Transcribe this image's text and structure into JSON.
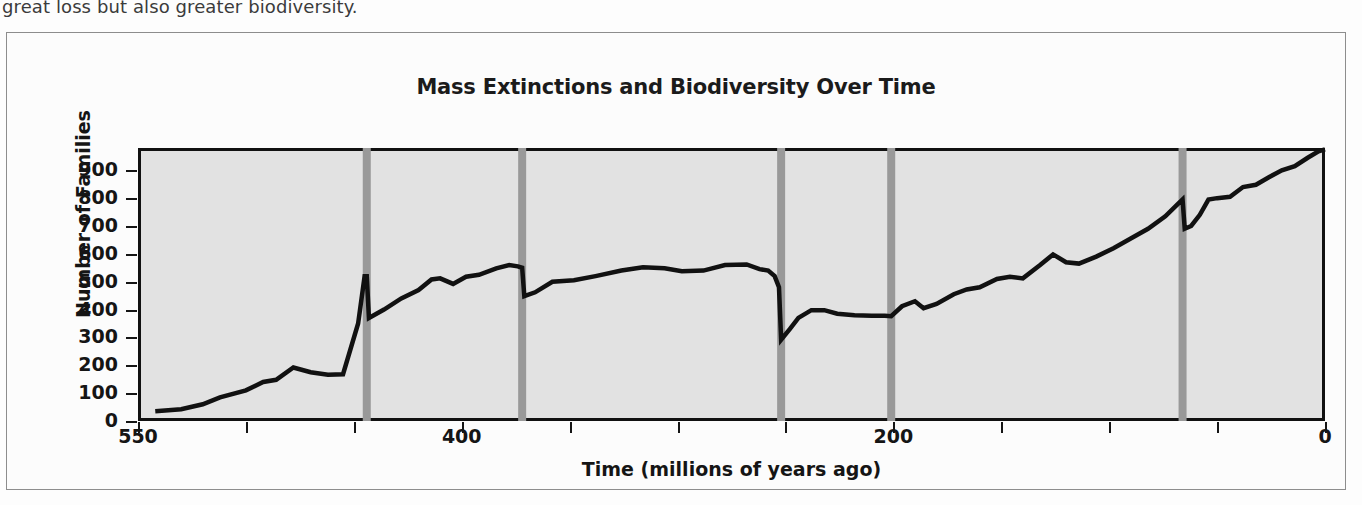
{
  "page": {
    "body_text": "great loss but also greater biodiversity."
  },
  "figure": {
    "title": "Mass Extinctions and Biodiversity Over Time"
  },
  "chart_data": {
    "type": "line",
    "title": "Mass Extinctions and Biodiversity Over Time",
    "xlabel": "Time (millions of years ago)",
    "ylabel": "Number of Families",
    "xlim": [
      550,
      0
    ],
    "ylim": [
      0,
      980
    ],
    "x_axis_reversed": true,
    "grid": false,
    "legend": null,
    "plot_background_color": "#e2e2e2",
    "line_color": "#111111",
    "extinction_bar_color": "#999999",
    "y_ticks": [
      0,
      100,
      200,
      300,
      400,
      500,
      600,
      700,
      800,
      900
    ],
    "y_tick_labels": [
      "0",
      "100",
      "200",
      "300",
      "400",
      "500",
      "600",
      "700",
      "800",
      "900"
    ],
    "x_ticks_major": [
      550,
      400,
      200,
      0
    ],
    "x_tick_labels_major": [
      "550",
      "400",
      "200",
      "0"
    ],
    "x_ticks_minor": [
      500,
      450,
      350,
      300,
      250,
      150,
      100,
      50
    ],
    "extinction_events": [
      {
        "label": "End-Ordovician",
        "time_mya": 444
      },
      {
        "label": "Late Devonian",
        "time_mya": 372
      },
      {
        "label": "End-Permian",
        "time_mya": 252
      },
      {
        "label": "End-Triassic",
        "time_mya": 201
      },
      {
        "label": "End-Cretaceous",
        "time_mya": 66
      }
    ],
    "series": [
      {
        "name": "Number of Families",
        "points": [
          [
            542,
            35
          ],
          [
            530,
            42
          ],
          [
            520,
            60
          ],
          [
            512,
            85
          ],
          [
            500,
            110
          ],
          [
            492,
            140
          ],
          [
            486,
            148
          ],
          [
            478,
            192
          ],
          [
            470,
            175
          ],
          [
            462,
            166
          ],
          [
            455,
            168
          ],
          [
            448,
            350
          ],
          [
            445,
            520
          ],
          [
            444,
            520
          ],
          [
            443,
            370
          ],
          [
            436,
            400
          ],
          [
            428,
            440
          ],
          [
            420,
            470
          ],
          [
            414,
            508
          ],
          [
            410,
            512
          ],
          [
            404,
            492
          ],
          [
            398,
            518
          ],
          [
            392,
            525
          ],
          [
            384,
            548
          ],
          [
            378,
            560
          ],
          [
            374,
            555
          ],
          [
            372,
            550
          ],
          [
            371,
            448
          ],
          [
            366,
            462
          ],
          [
            358,
            500
          ],
          [
            348,
            505
          ],
          [
            338,
            520
          ],
          [
            326,
            540
          ],
          [
            316,
            552
          ],
          [
            306,
            548
          ],
          [
            298,
            538
          ],
          [
            288,
            540
          ],
          [
            278,
            560
          ],
          [
            268,
            562
          ],
          [
            262,
            545
          ],
          [
            258,
            540
          ],
          [
            255,
            520
          ],
          [
            253,
            480
          ],
          [
            252,
            292
          ],
          [
            248,
            330
          ],
          [
            244,
            370
          ],
          [
            238,
            398
          ],
          [
            232,
            398
          ],
          [
            226,
            385
          ],
          [
            218,
            380
          ],
          [
            210,
            378
          ],
          [
            204,
            378
          ],
          [
            201,
            376
          ],
          [
            196,
            412
          ],
          [
            190,
            430
          ],
          [
            186,
            405
          ],
          [
            180,
            420
          ],
          [
            172,
            455
          ],
          [
            166,
            472
          ],
          [
            160,
            480
          ],
          [
            152,
            510
          ],
          [
            146,
            518
          ],
          [
            140,
            512
          ],
          [
            132,
            560
          ],
          [
            126,
            598
          ],
          [
            120,
            570
          ],
          [
            114,
            565
          ],
          [
            106,
            590
          ],
          [
            98,
            620
          ],
          [
            90,
            655
          ],
          [
            82,
            690
          ],
          [
            74,
            735
          ],
          [
            68,
            780
          ],
          [
            66,
            795
          ],
          [
            65,
            690
          ],
          [
            62,
            700
          ],
          [
            58,
            740
          ],
          [
            54,
            795
          ],
          [
            50,
            800
          ],
          [
            44,
            805
          ],
          [
            38,
            840
          ],
          [
            32,
            848
          ],
          [
            26,
            875
          ],
          [
            20,
            900
          ],
          [
            14,
            915
          ],
          [
            8,
            945
          ],
          [
            3,
            968
          ],
          [
            0,
            975
          ]
        ]
      }
    ]
  }
}
